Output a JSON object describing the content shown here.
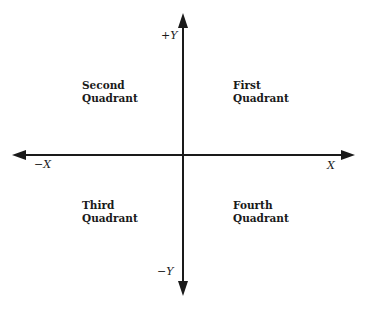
{
  "diagram": {
    "colors": {
      "axis": "#1a1a1a",
      "text": "#1a1a1a",
      "background": "#ffffff"
    },
    "axes": {
      "x_positive_label": "X",
      "x_negative_label": "−X",
      "y_positive_label": "+Y",
      "y_negative_label": "−Y"
    },
    "quadrants": {
      "first": {
        "line1": "First",
        "line2": "Quadrant"
      },
      "second": {
        "line1": "Second",
        "line2": "Quadrant"
      },
      "third": {
        "line1": "Third",
        "line2": "Quadrant"
      },
      "fourth": {
        "line1": "Fourth",
        "line2": "Quadrant"
      }
    }
  }
}
